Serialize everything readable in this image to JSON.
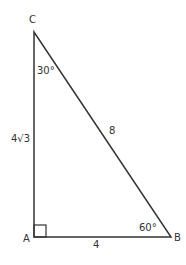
{
  "diagram": {
    "type": "right-triangle",
    "stroke_color": "#333333",
    "background": "#ffffff",
    "vertices": [
      {
        "name": "A",
        "label": "A",
        "x": 34,
        "y": 237
      },
      {
        "name": "B",
        "label": "B",
        "x": 171,
        "y": 237
      },
      {
        "name": "C",
        "label": "C",
        "x": 34,
        "y": 32
      }
    ],
    "sides": [
      {
        "between": "AB",
        "label": "4"
      },
      {
        "between": "AC",
        "label": "4√3"
      },
      {
        "between": "BC",
        "label": "8"
      }
    ],
    "angles": [
      {
        "at": "A",
        "label": "",
        "right_angle": true
      },
      {
        "at": "B",
        "label": "60°"
      },
      {
        "at": "C",
        "label": "30°"
      }
    ]
  }
}
